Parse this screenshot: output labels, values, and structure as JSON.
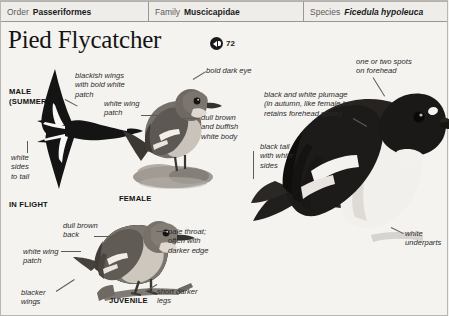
{
  "taxonomy": [
    {
      "label": "Order",
      "value": "Passeriformes",
      "italic": false
    },
    {
      "label": "Family",
      "value": "Muscicapidae",
      "italic": false
    },
    {
      "label": "Species",
      "value": "Ficedula hypoleuca",
      "italic": true
    }
  ],
  "title": "Pied Flycatcher",
  "audio": {
    "track_number": "72",
    "icon": "speaker-icon"
  },
  "captions": {
    "male_summer": "MALE\n(SUMMER)",
    "in_flight": "IN FLIGHT",
    "female": "FEMALE",
    "juvenile": "JUVENILE"
  },
  "annotations": {
    "white_sides_to_tail": "white\nsides\nto tail",
    "blackish_wings": "blackish wings\nwith bold white\npatch",
    "white_wing_patch_female": "white wing\npatch",
    "bold_dark_eye": "bold dark eye",
    "dull_brown_buffish": "dull brown\nand buffish\nwhite body",
    "black_tail_white_sides": "black tail\nwith white\nsides",
    "forehead_spots": "one or two spots\non forehead",
    "black_white_plumage": "black and white plumage\n(in autumn, like female but\nretains forehead spots)",
    "white_underparts": "white\nunderparts",
    "dull_brown_back": "dull brown\nback",
    "white_wing_patch_juv": "white wing\npatch",
    "blacker_wings": "blacker\nwings",
    "pale_throat": "pale throat;\noften with\ndarker edge",
    "short_darker_legs": "short darker\nlegs"
  },
  "colors": {
    "page_background": "#f4f3f0",
    "header_background": "#efedea",
    "border": "#9b9893",
    "text": "#1b1b1b",
    "label_text": "#5d5b57",
    "leader_line": "#5d5b57",
    "plumage_black": "#1a1a1a",
    "plumage_white": "#f7f6f4",
    "plumage_brown": "#7a7068"
  }
}
